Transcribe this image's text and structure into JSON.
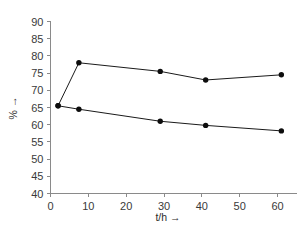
{
  "chart_data": {
    "type": "line",
    "title": "",
    "subtitle": "",
    "xlabel": "t/h →",
    "ylabel": "% →",
    "xlim": [
      0,
      65
    ],
    "ylim": [
      40,
      90
    ],
    "xticks": [
      0,
      10,
      20,
      30,
      40,
      50,
      60
    ],
    "xtick_labels": [
      "0",
      "10",
      "20",
      "30",
      "40",
      "50",
      "60"
    ],
    "yticks": [
      40,
      45,
      50,
      55,
      60,
      65,
      70,
      75,
      80,
      85,
      90
    ],
    "ytick_labels": [
      "40",
      "45",
      "50",
      "55",
      "60",
      "65",
      "70",
      "75",
      "80",
      "85",
      "90"
    ],
    "grid": false,
    "legend": "none",
    "marker": "filled-circle",
    "line_color": "#1a1a1a",
    "marker_color": "#0d0d0d",
    "axis_color": "#8a8a8a",
    "background": "#ffffff",
    "series": [
      {
        "name": "upper-curve",
        "x": [
          2,
          7.5,
          29,
          41,
          61
        ],
        "values": [
          65.5,
          78.0,
          75.5,
          73.0,
          74.5
        ]
      },
      {
        "name": "lower-curve",
        "x": [
          2,
          7.5,
          29,
          41,
          61
        ],
        "values": [
          65.5,
          64.5,
          61.0,
          59.8,
          58.2
        ]
      }
    ]
  }
}
